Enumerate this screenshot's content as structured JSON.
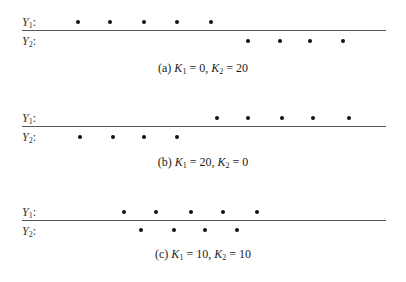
{
  "chart_data": {
    "type": "scatter",
    "title": "",
    "panels": [
      {
        "id": "a",
        "caption": {
          "prefix": "(a)",
          "k1": "0",
          "k2": "20"
        },
        "rows": [
          {
            "label": "Y",
            "sub": "1",
            "dots_x": [
              78,
              110,
              144,
              177,
              211
            ]
          },
          {
            "label": "Y",
            "sub": "2",
            "dots_x": [
              248,
              280,
              310,
              343
            ]
          }
        ]
      },
      {
        "id": "b",
        "caption": {
          "prefix": "(b)",
          "k1": "20",
          "k2": "0"
        },
        "rows": [
          {
            "label": "Y",
            "sub": "1",
            "dots_x": [
              217,
              248,
              282,
              313,
              349
            ]
          },
          {
            "label": "Y",
            "sub": "2",
            "dots_x": [
              80,
              113,
              144,
              177
            ]
          }
        ]
      },
      {
        "id": "c",
        "caption": {
          "prefix": "(c)",
          "k1": "10",
          "k2": "10"
        },
        "rows": [
          {
            "label": "Y",
            "sub": "1",
            "dots_x": [
              124,
              156,
              191,
              223,
              257
            ]
          },
          {
            "label": "Y",
            "sub": "2",
            "dots_x": [
              141,
              174,
              205,
              237
            ]
          }
        ]
      }
    ],
    "k_label_1": "K",
    "k_label_2": "K",
    "grid": false
  },
  "labels": {
    "y": "Y",
    "sub1": "1",
    "sub2": "2",
    "colon": ":",
    "k": "K",
    "eq": " = ",
    "comma": ", "
  },
  "panels": [
    {
      "top": 0,
      "prefix": "(a)",
      "k1": "0",
      "k2": "20"
    },
    {
      "top": 96,
      "prefix": "(b)",
      "k1": "20",
      "k2": "0"
    },
    {
      "top": 190,
      "prefix": "(c)",
      "k1": "10",
      "k2": "10"
    }
  ]
}
